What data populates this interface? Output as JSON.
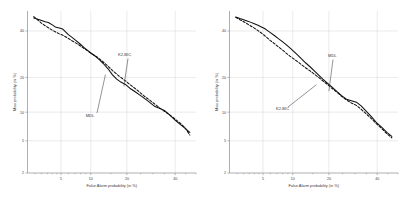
{
  "figure": {
    "background": "#ffffff",
    "panel_count": 2
  },
  "chart_data": [
    {
      "type": "line",
      "panel": "left",
      "title": "",
      "xlabel": "False Alarm probability (in %)",
      "ylabel": "Miss probability (in %)",
      "scale": "normal-deviate (DET)",
      "grid": true,
      "legend_position": "inline-annotations",
      "xticks": [
        5,
        10,
        20,
        40
      ],
      "xticklabels": [
        "5",
        "10",
        "20",
        "40"
      ],
      "yticks": [
        2,
        5,
        10,
        20,
        40
      ],
      "yticklabels": [
        "2",
        "5",
        "10",
        "20",
        "40"
      ],
      "xlim": [
        2,
        50
      ],
      "ylim": [
        2,
        50
      ],
      "annotations": [
        {
          "text": "K2-BIC",
          "target_x": 19.0,
          "target_y": 17.0
        },
        {
          "text": "MDL",
          "target_x": 13.5,
          "target_y": 21.0
        }
      ],
      "series": [
        {
          "name": "MDL",
          "style": "solid",
          "color": "#101010",
          "x": [
            2.4,
            2.7,
            3.0,
            3.3,
            3.6,
            4.0,
            4.4,
            4.8,
            5.2,
            5.6,
            6.0,
            6.6,
            7.2,
            7.9,
            8.6,
            9.4,
            10.2,
            11.1,
            12.0,
            13.0,
            14.2,
            15.4,
            16.7,
            18.0,
            19.5,
            21.0,
            22.8,
            24.6,
            26.5,
            28.5,
            30.6,
            32.8,
            35.0,
            37.4,
            39.8,
            42.2,
            44.6,
            47.0
          ],
          "y": [
            46.5,
            45.8,
            45.2,
            44.6,
            44.2,
            43.0,
            41.8,
            41.5,
            41.0,
            39.6,
            38.2,
            36.8,
            35.4,
            33.8,
            32.2,
            30.8,
            29.4,
            28.2,
            26.8,
            25.2,
            23.2,
            21.0,
            19.4,
            18.4,
            17.6,
            16.4,
            15.4,
            14.4,
            13.4,
            12.4,
            11.4,
            10.9,
            10.4,
            9.4,
            8.4,
            7.6,
            6.9,
            6.2
          ]
        },
        {
          "name": "K2-BIC",
          "style": "dashed",
          "color": "#101010",
          "x": [
            2.4,
            2.7,
            3.0,
            3.3,
            3.6,
            4.0,
            4.4,
            4.8,
            5.2,
            5.6,
            6.0,
            6.6,
            7.2,
            7.9,
            8.6,
            9.4,
            10.2,
            11.1,
            12.0,
            13.0,
            14.2,
            15.4,
            16.7,
            18.0,
            19.5,
            21.0,
            22.8,
            24.6,
            26.5,
            28.5,
            30.6,
            32.8,
            35.0,
            37.4,
            39.8,
            42.2,
            44.6,
            47.0
          ],
          "y": [
            47.2,
            45.4,
            43.8,
            42.6,
            41.6,
            40.4,
            39.4,
            38.6,
            38.0,
            37.2,
            36.4,
            35.2,
            34.2,
            33.0,
            31.8,
            30.6,
            29.4,
            28.4,
            27.2,
            25.8,
            24.2,
            22.6,
            21.2,
            20.0,
            18.8,
            17.6,
            16.4,
            15.2,
            14.0,
            13.0,
            12.0,
            11.0,
            10.2,
            9.4,
            8.6,
            7.8,
            7.0,
            5.8
          ]
        }
      ]
    },
    {
      "type": "line",
      "panel": "right",
      "title": "",
      "xlabel": "False Alarm probability (in %)",
      "ylabel": "Miss probability (in %)",
      "scale": "normal-deviate (DET)",
      "grid": true,
      "legend_position": "inline-annotations",
      "xticks": [
        5,
        10,
        20,
        40
      ],
      "xticklabels": [
        "5",
        "10",
        "20",
        "40"
      ],
      "yticks": [
        2,
        5,
        10,
        20,
        40
      ],
      "yticklabels": [
        "2",
        "5",
        "10",
        "20",
        "40"
      ],
      "xlim": [
        2,
        50
      ],
      "ylim": [
        2,
        50
      ],
      "annotations": [
        {
          "text": "MDL",
          "target_x": 20.0,
          "target_y": 15.5
        },
        {
          "text": "K2-BIC",
          "target_x": 16.0,
          "target_y": 17.5
        }
      ],
      "series": [
        {
          "name": "MDL",
          "style": "solid",
          "color": "#101010",
          "x": [
            2.4,
            2.7,
            3.0,
            3.3,
            3.6,
            4.0,
            4.4,
            4.8,
            5.2,
            5.6,
            6.0,
            6.6,
            7.2,
            7.9,
            8.6,
            9.4,
            10.2,
            11.1,
            12.0,
            13.0,
            14.2,
            15.4,
            16.7,
            18.0,
            19.5,
            21.0,
            22.8,
            24.6,
            26.5,
            28.5,
            30.6,
            32.8,
            35.0,
            37.4,
            39.8,
            42.2,
            44.6,
            47.0
          ],
          "y": [
            47.0,
            46.2,
            45.6,
            45.0,
            44.4,
            43.6,
            42.8,
            42.0,
            41.2,
            40.2,
            39.2,
            37.8,
            36.4,
            35.0,
            33.6,
            32.0,
            30.4,
            28.8,
            27.2,
            25.6,
            24.0,
            22.4,
            20.8,
            19.4,
            18.0,
            16.8,
            15.4,
            14.2,
            13.2,
            12.8,
            12.4,
            11.4,
            10.2,
            9.0,
            7.8,
            7.0,
            6.2,
            5.6
          ]
        },
        {
          "name": "K2-BIC",
          "style": "dashed",
          "color": "#101010",
          "x": [
            2.4,
            2.7,
            3.0,
            3.3,
            3.6,
            4.0,
            4.4,
            4.8,
            5.2,
            5.6,
            6.0,
            6.6,
            7.2,
            7.9,
            8.6,
            9.4,
            10.2,
            11.1,
            12.0,
            13.0,
            14.2,
            15.4,
            16.7,
            18.0,
            19.5,
            21.0,
            22.8,
            24.6,
            26.5,
            28.5,
            30.6,
            32.8,
            35.0,
            37.4,
            39.8,
            42.2,
            44.6,
            47.0
          ],
          "y": [
            46.8,
            45.6,
            44.6,
            43.6,
            42.6,
            41.4,
            40.2,
            39.0,
            37.8,
            36.6,
            35.4,
            34.0,
            32.6,
            31.2,
            29.8,
            28.4,
            27.2,
            26.0,
            24.8,
            23.6,
            22.4,
            21.2,
            20.0,
            18.8,
            17.6,
            16.4,
            15.2,
            14.0,
            13.0,
            12.2,
            11.6,
            10.6,
            9.6,
            8.6,
            7.6,
            6.8,
            6.0,
            5.4
          ]
        }
      ]
    }
  ]
}
